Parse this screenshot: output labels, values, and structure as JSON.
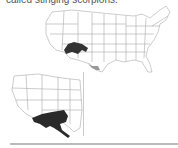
{
  "caption": {
    "text": "called stinging scorpions."
  },
  "maps": {
    "main": {
      "label": "United States map",
      "range_color": "#333333",
      "secondary_range_color": "#999999",
      "state_line_color": "#aaaaaa"
    },
    "inset": {
      "label": "Southwestern US and Mexico map",
      "range_color": "#2a2a2a",
      "state_line_color": "#aaaaaa"
    }
  }
}
